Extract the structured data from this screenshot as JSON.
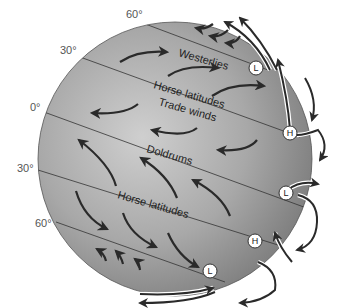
{
  "latitude_labels": {
    "north_60": "60°",
    "north_30": "30°",
    "equator": "0°",
    "south_30": "30°",
    "south_60": "60°"
  },
  "belts": {
    "westerlies": "Westerlies",
    "horse_latitudes_north": "Horse latitudes",
    "trade_winds": "Trade winds",
    "doldrums": "Doldrums",
    "horse_latitudes_south": "Horse latitudes"
  },
  "pressure_markers": [
    {
      "label": "L"
    },
    {
      "label": "H"
    },
    {
      "label": "L"
    },
    {
      "label": "H"
    },
    {
      "label": "L"
    }
  ],
  "colors": {
    "globe_light": "#c8c8c8",
    "globe_dark": "#7a7a7a",
    "arrow": "#2a2a2a",
    "background": "#ffffff"
  }
}
